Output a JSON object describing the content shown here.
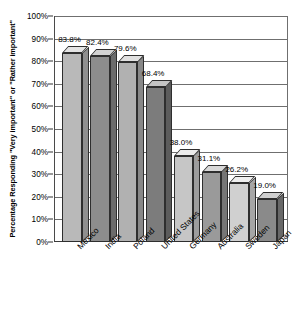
{
  "chart_data": {
    "type": "bar",
    "title": "",
    "subtitle": "",
    "xlabel": "",
    "ylabel": "Percentage Responding \"Very important\" or \"Rather important\"",
    "ylim": [
      0,
      100
    ],
    "grid": true,
    "legend": false,
    "style": "3d-bar-grayscale",
    "categories": [
      "Mexico",
      "India",
      "Poland",
      "United States",
      "Germany",
      "Australia",
      "Sweden",
      "Japan"
    ],
    "values": [
      83.8,
      82.4,
      79.6,
      68.4,
      38.0,
      31.1,
      26.2,
      19.0
    ],
    "value_labels": [
      "83.8%",
      "82.4%",
      "79.6%",
      "68.4%",
      "38.0%",
      "31.1%",
      "26.2%",
      "19.0%"
    ],
    "ytick_labels": [
      "100%",
      "90%",
      "80%",
      "70%",
      "60%",
      "50%",
      "40%",
      "30%",
      "20%",
      "10%",
      "0%"
    ],
    "ytick_values": [
      100,
      90,
      80,
      70,
      60,
      50,
      40,
      30,
      20,
      10,
      0
    ],
    "bar_colors": [
      "#b9b9b9",
      "#8d8d8d",
      "#b1b1b1",
      "#7c7c7c",
      "#c6c6c6",
      "#9a9a9a",
      "#d0d0d0",
      "#8a8a8a"
    ],
    "bar_top_colors": [
      "#e4e4e4",
      "#d2d2d2",
      "#e0e0e0",
      "#c4c4c4",
      "#ebebeb",
      "#d8d8d8",
      "#efefef",
      "#cfcfcf"
    ],
    "bar_side_colors": [
      "#8f8f8f",
      "#6b6b6b",
      "#888888",
      "#5c5c5c",
      "#9d9d9d",
      "#767676",
      "#a6a6a6",
      "#686868"
    ],
    "axis_color": "#4a4a4a",
    "grid_color": "#6f6f6f",
    "text_color": "#000000",
    "background": "#ffffff"
  }
}
